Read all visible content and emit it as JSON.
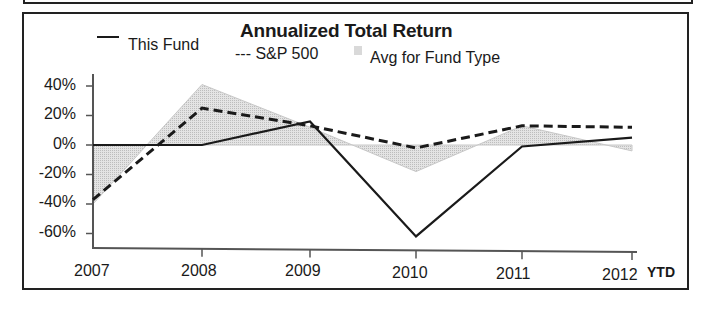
{
  "chart_data": {
    "type": "line",
    "title": "Annualized Total Return",
    "xlabel": "",
    "ylabel": "",
    "categories": [
      "2007",
      "2008",
      "2009",
      "2010",
      "2011",
      "2012"
    ],
    "x_suffix_label": "YTD",
    "ylim": [
      -70,
      50
    ],
    "yticks": [
      "40%",
      "20%",
      "0%",
      "-20%",
      "-40%",
      "-60%"
    ],
    "grid": false,
    "legend_position": "top",
    "series": [
      {
        "name": "This Fund",
        "style": "solid",
        "values": [
          0,
          0,
          16,
          -62,
          -1,
          5
        ]
      },
      {
        "name": "S&P 500",
        "style": "dashed",
        "values": [
          -37,
          25,
          13,
          -2,
          13,
          12
        ]
      },
      {
        "name": "Avg for Fund Type",
        "style": "area",
        "values": [
          -40,
          41,
          12,
          -18,
          13,
          -4
        ]
      }
    ]
  },
  "legend": {
    "this_fund": "This Fund",
    "sp500": "--- S&P 500",
    "avg": "Avg for Fund Type"
  },
  "colors": {
    "line": "#1a1a1a",
    "area_fill": "#d9d9d9"
  }
}
